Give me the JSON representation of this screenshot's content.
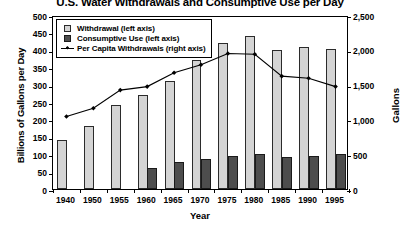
{
  "chart_data": {
    "type": "bar",
    "title": "U.S. Water Withdrawals and Consumptive Use per Day",
    "xlabel": "Year",
    "ylabel": "Billions of Gallons per Day",
    "y2label": "Gallons",
    "categories": [
      "1940",
      "1950",
      "1955",
      "1960",
      "1965",
      "1970",
      "1975",
      "1980",
      "1985",
      "1990",
      "1995"
    ],
    "ylim": [
      0,
      500
    ],
    "y2lim": [
      0,
      2500
    ],
    "yticks": [
      "0",
      "50",
      "100",
      "150",
      "200",
      "250",
      "300",
      "350",
      "400",
      "450",
      "500"
    ],
    "ytick_values": [
      0,
      50,
      100,
      150,
      200,
      250,
      300,
      350,
      400,
      450,
      500
    ],
    "y2ticks": [
      "0",
      "500",
      "1,000",
      "1,500",
      "2,000",
      "2,500"
    ],
    "y2tick_values": [
      0,
      500,
      1000,
      1500,
      2000,
      2500
    ],
    "grid": false,
    "legend_position": "upper-left",
    "series": [
      {
        "name": "Withdrawal (left axis)",
        "type": "bar",
        "axis": "left",
        "color": "#d4d4d4",
        "values": [
          140,
          180,
          240,
          270,
          310,
          370,
          420,
          440,
          399,
          408,
          402
        ]
      },
      {
        "name": "Consumptive Use (left axis)",
        "type": "bar",
        "axis": "left",
        "color": "#4d4d4d",
        "values": [
          0,
          0,
          0,
          61,
          77,
          87,
          96,
          100,
          92,
          94,
          100
        ]
      },
      {
        "name": "Per Capita Withdrawals (right axis)",
        "type": "line",
        "axis": "right",
        "color": "#000000",
        "marker": "diamond",
        "values": [
          1070,
          1190,
          1450,
          1500,
          1700,
          1815,
          1975,
          1965,
          1650,
          1620,
          1500
        ]
      }
    ]
  },
  "legend": {
    "items": [
      {
        "label": "Withdrawal (left axis)",
        "key": "swatch-light"
      },
      {
        "label": "Consumptive Use (left axis)",
        "key": "swatch-dark"
      },
      {
        "label": "Per Capita Withdrawals (right axis)",
        "key": "line-marker"
      }
    ]
  }
}
